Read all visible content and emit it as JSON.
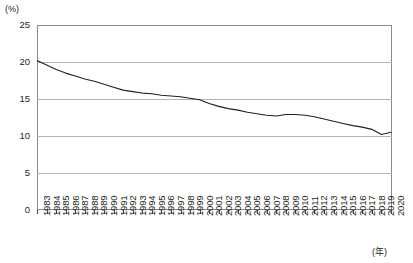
{
  "axis": {
    "unit_y": "(%)",
    "unit_x": "(年)",
    "y_ticks": [
      "25",
      "20",
      "15",
      "10",
      "5",
      "0"
    ],
    "x_ticks": [
      "1983",
      "1984",
      "1985",
      "1986",
      "1987",
      "1988",
      "1989",
      "1990",
      "1991",
      "1992",
      "1993",
      "1994",
      "1995",
      "1996",
      "1997",
      "1998",
      "1999",
      "2000",
      "2001",
      "2002",
      "2003",
      "2004",
      "2005",
      "2006",
      "2007",
      "2008",
      "2009",
      "2010",
      "2011",
      "2012",
      "2013",
      "2014",
      "2015",
      "2016",
      "2017",
      "2018",
      "2019",
      "2020"
    ]
  },
  "style": {
    "line_color": "#231f20",
    "grid_color": "#b5b5b5",
    "border_color": "#8a8a8a",
    "background": "#ffffff"
  },
  "chart_data": {
    "type": "line",
    "title": "",
    "subtitle": "",
    "xlabel": "(年)",
    "ylabel": "(%)",
    "xlim": [
      1983,
      2020
    ],
    "ylim": [
      0,
      25
    ],
    "ytick_values": [
      25,
      20,
      15,
      10,
      5,
      0
    ],
    "grid": true,
    "legend": null,
    "annotations": [],
    "x": [
      1983,
      1984,
      1985,
      1986,
      1987,
      1988,
      1989,
      1990,
      1991,
      1992,
      1993,
      1994,
      1995,
      1996,
      1997,
      1998,
      1999,
      2000,
      2001,
      2002,
      2003,
      2004,
      2005,
      2006,
      2007,
      2008,
      2009,
      2010,
      2011,
      2012,
      2013,
      2014,
      2015,
      2016,
      2017,
      2018,
      2019,
      2020
    ],
    "series": [
      {
        "name": "",
        "values": [
          20.2,
          19.6,
          19.0,
          18.5,
          18.1,
          17.7,
          17.4,
          17.0,
          16.6,
          16.2,
          16.0,
          15.8,
          15.7,
          15.5,
          15.4,
          15.3,
          15.1,
          14.9,
          14.4,
          14.0,
          13.7,
          13.5,
          13.2,
          13.0,
          12.8,
          12.7,
          12.9,
          12.9,
          12.8,
          12.6,
          12.3,
          12.0,
          11.7,
          11.4,
          11.2,
          10.9,
          10.2,
          10.5
        ]
      }
    ]
  }
}
